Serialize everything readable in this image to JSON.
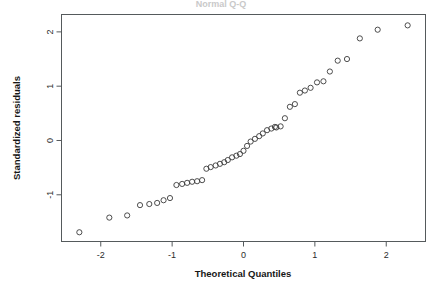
{
  "figure": {
    "title": "Normal Q-Q",
    "background": "#ffffff",
    "frame_color": "#555a5c",
    "point_color": "#3a3a3a"
  },
  "axes": {
    "x_title": "Theoretical Quantiles",
    "y_title": "Standardized residuals",
    "x_ticks": [
      "-2",
      "-1",
      "0",
      "1",
      "2"
    ],
    "y_ticks": [
      "-1",
      "0",
      "1",
      "2"
    ]
  },
  "chart_data": {
    "type": "scatter",
    "title": "Normal Q-Q",
    "xlabel": "Theoretical Quantiles",
    "ylabel": "Standardized residuals",
    "xlim": [
      -2.55,
      2.55
    ],
    "ylim": [
      -1.86,
      2.32
    ],
    "xticks": [
      -2,
      -1,
      0,
      1,
      2
    ],
    "yticks": [
      -1,
      0,
      1,
      2
    ],
    "grid": false,
    "legend": "none",
    "marker": "open-circle",
    "n_points": 48,
    "x": [
      -2.3,
      -1.88,
      -1.63,
      -1.45,
      -1.32,
      -1.21,
      -1.12,
      -1.03,
      -0.94,
      -0.86,
      -0.79,
      -0.72,
      -0.65,
      -0.58,
      -0.52,
      -0.46,
      -0.39,
      -0.33,
      -0.27,
      -0.22,
      -0.16,
      -0.1,
      -0.05,
      0.0,
      0.05,
      0.1,
      0.16,
      0.22,
      0.27,
      0.33,
      0.39,
      0.46,
      0.52,
      0.58,
      0.65,
      0.72,
      0.79,
      0.86,
      0.94,
      1.03,
      1.12,
      1.21,
      1.32,
      1.45,
      1.63,
      1.88,
      2.3,
      0.44
    ],
    "y": [
      -1.69,
      -1.42,
      -1.38,
      -1.19,
      -1.17,
      -1.15,
      -1.1,
      -1.06,
      -0.82,
      -0.8,
      -0.78,
      -0.76,
      -0.75,
      -0.73,
      -0.52,
      -0.49,
      -0.46,
      -0.43,
      -0.4,
      -0.36,
      -0.31,
      -0.28,
      -0.25,
      -0.19,
      -0.1,
      -0.02,
      0.03,
      0.08,
      0.13,
      0.19,
      0.22,
      0.24,
      0.26,
      0.41,
      0.62,
      0.67,
      0.88,
      0.92,
      0.97,
      1.07,
      1.09,
      1.27,
      1.47,
      1.5,
      1.88,
      2.04,
      2.12,
      0.25
    ]
  }
}
